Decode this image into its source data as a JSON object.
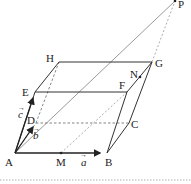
{
  "diagram": {
    "type": "parallelepiped",
    "colors": {
      "line": "#333333",
      "dashed": "#666666",
      "bg": "#ffffff"
    },
    "points": {
      "A": {
        "label": "A",
        "x": 15,
        "y": 153
      },
      "B": {
        "label": "B",
        "x": 107,
        "y": 153
      },
      "C": {
        "label": "C",
        "x": 129,
        "y": 123
      },
      "D": {
        "label": "D",
        "x": 36,
        "y": 123
      },
      "E": {
        "label": "E",
        "x": 35,
        "y": 92
      },
      "F": {
        "label": "F",
        "x": 127,
        "y": 92
      },
      "G": {
        "label": "G",
        "x": 152,
        "y": 62
      },
      "H": {
        "label": "H",
        "x": 59,
        "y": 62
      },
      "M": {
        "label": "M",
        "x": 61,
        "y": 153
      },
      "N": {
        "label": "N",
        "x": 140,
        "y": 77
      },
      "P": {
        "label": "P",
        "x": 175,
        "y": 1
      }
    },
    "vectors": {
      "a": {
        "label": "a",
        "from": "A",
        "to": "B"
      },
      "b": {
        "label": "b",
        "from": "A",
        "to": "D"
      },
      "c": {
        "label": "c",
        "from": "A",
        "to": "E"
      }
    }
  }
}
